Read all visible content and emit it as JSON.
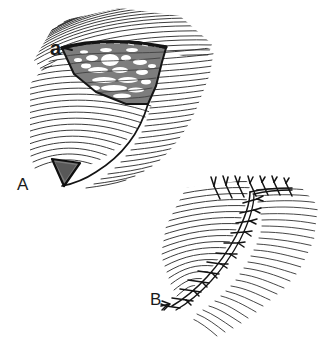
{
  "figure": {
    "kind": "surgical-line-drawing",
    "background_color": "#ffffff",
    "ink_color": "#1a1a1a",
    "width": 329,
    "height": 349,
    "panels": [
      {
        "id": "A",
        "label": "A",
        "label_x": 17,
        "label_y": 176,
        "description": "Wedge-shaped tissue excision with hatched skin field, shaded specimen and small dark triangular flap",
        "callouts": [
          {
            "id": "a",
            "label": "a",
            "label_x": 50,
            "label_y": 38,
            "points_to": "shaded-wedge-specimen"
          }
        ]
      },
      {
        "id": "B",
        "label": "B",
        "label_x": 150,
        "label_y": 291,
        "description": "Closed wound with curved line of interrupted sutures across hatched skin field",
        "callouts": []
      }
    ],
    "colors": {
      "ink": "#1a1a1a",
      "hatch": "#262626",
      "wedge_fill": "#8c8c8c",
      "wedge_fill_dark": "#6e6e6e",
      "highlight": "#ffffff",
      "triangle_fill": "#7a7a7a",
      "suture_fill": "#ffffff",
      "background": "#ffffff"
    },
    "hatching": {
      "panel_a_upper_lines": 46,
      "panel_a_lower_lines": 40,
      "panel_b_left_lines": 34,
      "panel_b_right_lines": 40,
      "stroke_width": 0.9
    },
    "suture_count": 17
  }
}
